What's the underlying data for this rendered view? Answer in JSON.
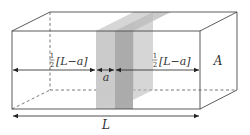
{
  "diagram": {
    "type": "3d-box-with-slabs",
    "colors": {
      "line": "#4a4a4a",
      "dashed": "#6a6a6a",
      "slab_light": "#c9c9c9",
      "slab_dark": "#a8a8a8",
      "slab_top_light": "#dadada",
      "slab_top_dark": "#bdbdbd",
      "text": "#333333"
    },
    "labels": {
      "left_segment": "½[L−a]",
      "left_half": "1",
      "left_den": "2",
      "left_bracket": "[L−a]",
      "gap": "a",
      "right_half": "1",
      "right_den": "2",
      "right_bracket": "[L−a]",
      "area": "A",
      "length": "L"
    }
  }
}
